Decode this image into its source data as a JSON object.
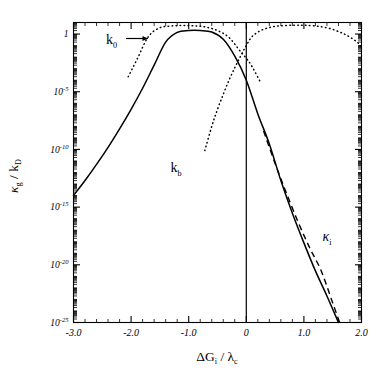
{
  "chart_data": {
    "type": "line",
    "title": "",
    "xlabel": "ΔG_i / λ_c",
    "ylabel": "κ_g / k_D",
    "xlim": [
      -3.0,
      2.0
    ],
    "ylim": [
      1e-25,
      10
    ],
    "yscale": "log",
    "grid": false,
    "legend": "annotations-inline",
    "xticks": [
      -3.0,
      -2.0,
      -1.0,
      0,
      1.0,
      2.0
    ],
    "xticklabels": [
      "-3.0",
      "-2.0",
      "-1.0",
      "0",
      "1.0",
      "2.0"
    ],
    "yticks": [
      1,
      1e-05,
      1e-10,
      1e-15,
      1e-20,
      1e-25
    ],
    "yticklabels": [
      "1",
      "10^-5",
      "10^-10",
      "10^-15",
      "10^-20",
      "10^-25"
    ],
    "x_minor_per_decade": 4,
    "y_minor_per_decade": 9,
    "zero_reference_line_x": 0,
    "series": [
      {
        "name": "kappa_g",
        "style": "solid",
        "label": "",
        "comment": "overall rate: rises from lower-left, plateaus near 1 between -1.5 and -0.5, falls steeply to 1e-25 at x=1.6",
        "x": [
          -3.0,
          -2.8,
          -2.6,
          -2.4,
          -2.2,
          -2.0,
          -1.8,
          -1.6,
          -1.4,
          -1.2,
          -1.0,
          -0.8,
          -0.6,
          -0.4,
          -0.2,
          0.0,
          0.2,
          0.4,
          0.6,
          0.8,
          1.0,
          1.2,
          1.4,
          1.6
        ],
        "y": [
          1e-14,
          2e-13,
          5e-12,
          1.5e-10,
          6e-09,
          3e-07,
          2e-05,
          0.002,
          0.2,
          1.4,
          2.0,
          2.0,
          1.5,
          0.35,
          0.012,
          0.0001,
          1.2e-07,
          3e-10,
          2e-13,
          3e-16,
          8e-19,
          3e-21,
          2e-23,
          1e-25
        ]
      },
      {
        "name": "kappa_i",
        "style": "dashed",
        "label": "κ_i",
        "comment": "activation-limited asymptote; nearly coincident with solid curve for x>0.3, slightly above it, reaching 1e-25 near x=1.62",
        "x": [
          0.3,
          0.5,
          0.7,
          0.9,
          1.1,
          1.3,
          1.5,
          1.62
        ],
        "y": [
          4e-09,
          6e-12,
          1.5e-14,
          5e-17,
          3e-19,
          3e-21,
          5e-24,
          1e-25
        ]
      },
      {
        "name": "k_0",
        "style": "dotted",
        "label": "k₀",
        "comment": "forward rate constant; broad dotted maximum just above 1 around x=-1.0, descending right through the origin region",
        "x": [
          -2.05,
          -1.9,
          -1.7,
          -1.5,
          -1.3,
          -1.1,
          -0.9,
          -0.7,
          -0.5,
          -0.3,
          -0.1,
          0.0,
          0.1,
          0.25
        ],
        "y": [
          0.0002,
          0.006,
          0.6,
          3.5,
          5.0,
          5.4,
          5.2,
          4.0,
          2.0,
          0.5,
          0.03,
          0.008,
          0.0015,
          6e-05
        ]
      },
      {
        "name": "k_b",
        "style": "dotted",
        "label": "kᵇ",
        "comment": "backward rate constant; left branch plunges to 1e-10 near x=-0.72, right branch peaks just above 1 at x=1.0 and decays to the right frame edge at x=2.0",
        "x": [
          -0.72,
          -0.6,
          -0.5,
          -0.4,
          -0.3,
          -0.2,
          -0.1,
          0.0,
          0.1,
          0.25,
          0.45,
          0.65,
          0.85,
          1.0,
          1.2,
          1.45,
          1.7,
          1.9,
          2.0
        ],
        "y": [
          8e-11,
          1e-08,
          3e-07,
          6e-06,
          0.0001,
          0.0012,
          0.012,
          0.1,
          0.6,
          2.0,
          4.2,
          5.4,
          5.8,
          5.8,
          5.0,
          3.0,
          1.0,
          0.25,
          0.08
        ]
      }
    ],
    "annotations": [
      {
        "name": "k0-label",
        "text": "k₀",
        "x": -2.05,
        "has_arrow": true,
        "arrow_points_to": "k_0 dotted curve"
      },
      {
        "name": "kb-label",
        "text": "kᵇ",
        "x": -0.62
      },
      {
        "name": "kappa-i-label",
        "text": "κᵢ",
        "x": 1.28
      }
    ]
  },
  "axes": {
    "x_title_parts": {
      "delta": "Δ",
      "g": "G",
      "g_sub": "i",
      "slash": " / ",
      "lambda": "λ",
      "lambda_sub": "c"
    },
    "y_title_parts": {
      "kappa": "κ",
      "kappa_sub": "g",
      "slash": " / ",
      "k": "k",
      "k_sub": "D"
    },
    "xticklabels": [
      "-3.0",
      "-2.0",
      "-1.0",
      "0",
      "1.0",
      "2.0"
    ],
    "ytick_mantissa": "10",
    "ytick_exponents": [
      "",
      "-5",
      "-10",
      "-15",
      "-20",
      "-25"
    ],
    "ytick_first_label": "1"
  },
  "annotations": {
    "k0": {
      "base": "k",
      "sub": "0"
    },
    "kb": {
      "base": "k",
      "sub": "b"
    },
    "kappa_i": {
      "base": "κ",
      "sub": "i"
    }
  },
  "colors": {
    "background": "#ffffff",
    "ink": "#000000"
  }
}
